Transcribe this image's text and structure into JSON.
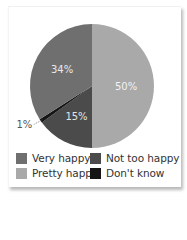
{
  "chart_data": {
    "type": "pie",
    "title": "",
    "categories": [
      "Pretty happy",
      "Not too happy",
      "Don't know",
      "Very happy"
    ],
    "values": [
      50,
      15,
      1,
      34
    ],
    "labels": [
      "50%",
      "15%",
      "1%",
      "34%"
    ],
    "colors": [
      "#a9a9a9",
      "#4b4b4b",
      "#151515",
      "#6f6f6f"
    ],
    "start_angle_deg": 0,
    "direction": "clockwise",
    "legend": {
      "position": "bottom",
      "entries": [
        {
          "label": "Very happy",
          "color": "#6f6f6f"
        },
        {
          "label": "Not too happy",
          "color": "#4b4b4b"
        },
        {
          "label": "Pretty happy",
          "color": "#a9a9a9"
        },
        {
          "label": "Don't know",
          "color": "#151515"
        }
      ]
    }
  },
  "legend": {
    "items": [
      {
        "label": "Very happy",
        "color": "#6f6f6f"
      },
      {
        "label": "Not too happy",
        "color": "#4b4b4b"
      },
      {
        "label": "Pretty happy",
        "color": "#a9a9a9"
      },
      {
        "label": "Don't know",
        "color": "#151515"
      }
    ]
  }
}
